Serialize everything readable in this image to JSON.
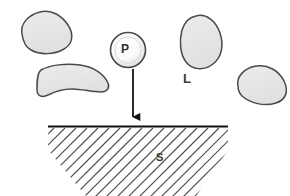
{
  "diagram": {
    "type": "schematic",
    "background_color": "#ffffff",
    "labels": {
      "particle": "P",
      "liquid": "L",
      "solid": "S"
    },
    "colors": {
      "blob_fill": "#e6e6e6",
      "blob_stroke": "#4a4a4a",
      "particle_fill_center": "#ffffff",
      "particle_fill_edge": "#d8d8d8",
      "particle_stroke": "#4a4a4a",
      "arrow": "#1a1a1a",
      "ground_line": "#1a1a1a",
      "hatch": "#4d4d4d",
      "text": "#3a3a3a"
    },
    "elements": {
      "particle_circle": {
        "name": "particle",
        "label": "P",
        "cx": 128,
        "cy": 50,
        "r": 18
      },
      "arrow": {
        "name": "deposition-arrow",
        "x": 133,
        "y_start": 70,
        "y_end": 125,
        "direction": "down"
      },
      "ground_line": {
        "name": "substrate-surface",
        "x_start": 48,
        "x_end": 228,
        "y": 126
      },
      "hatching": {
        "angle_deg": 45,
        "count": 22,
        "spacing": 11
      },
      "blobs": [
        {
          "name": "blob-top-left",
          "label": "",
          "cx": 42,
          "cy": 33
        },
        {
          "name": "blob-mid-left",
          "label": "",
          "cx": 72,
          "cy": 83
        },
        {
          "name": "blob-top-right",
          "label": "",
          "cx": 202,
          "cy": 42
        },
        {
          "name": "blob-right",
          "label": "",
          "cx": 258,
          "cy": 84
        }
      ]
    }
  }
}
